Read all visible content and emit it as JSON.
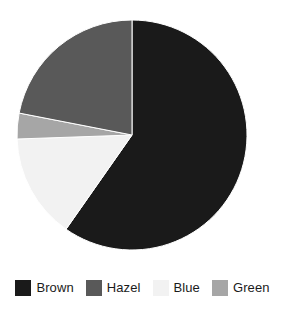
{
  "chart_data": {
    "type": "pie",
    "title": "",
    "subtitle": "",
    "xlabel": "",
    "ylabel": "",
    "grid": false,
    "legend_position": "bottom",
    "start_angle_deg": 0,
    "direction": "clockwise",
    "center": {
      "cx": 132,
      "cy": 135,
      "r": 115
    },
    "categories": [
      "Brown",
      "Hazel",
      "Blue",
      "Green"
    ],
    "values": [
      59.7,
      22.0,
      14.7,
      3.6
    ],
    "value_unit": "percent",
    "slice_angles_deg": [
      215.0,
      79.0,
      53.0,
      13.0
    ],
    "slice_boundaries_deg_cw_from_12": [
      0,
      215,
      268,
      281,
      360
    ],
    "colors": [
      "#1a1a1a",
      "#595959",
      "#f2f2f2",
      "#a6a6a6"
    ],
    "slices": [
      {
        "label": "Brown",
        "value": 59.7,
        "angle_deg": 215.0,
        "start_deg": 0,
        "end_deg": 215,
        "color": "#1a1a1a"
      },
      {
        "label": "Blue",
        "value": 14.7,
        "angle_deg": 53.0,
        "start_deg": 215,
        "end_deg": 268,
        "color": "#f2f2f2"
      },
      {
        "label": "Green",
        "value": 3.6,
        "angle_deg": 13.0,
        "start_deg": 268,
        "end_deg": 281,
        "color": "#a6a6a6"
      },
      {
        "label": "Hazel",
        "value": 22.0,
        "angle_deg": 79.0,
        "start_deg": 281,
        "end_deg": 360,
        "color": "#595959"
      }
    ]
  },
  "legend": {
    "items": [
      {
        "label": "Brown",
        "color": "#1a1a1a"
      },
      {
        "label": "Hazel",
        "color": "#595959"
      },
      {
        "label": "Blue",
        "color": "#f2f2f2"
      },
      {
        "label": "Green",
        "color": "#a6a6a6"
      }
    ]
  }
}
